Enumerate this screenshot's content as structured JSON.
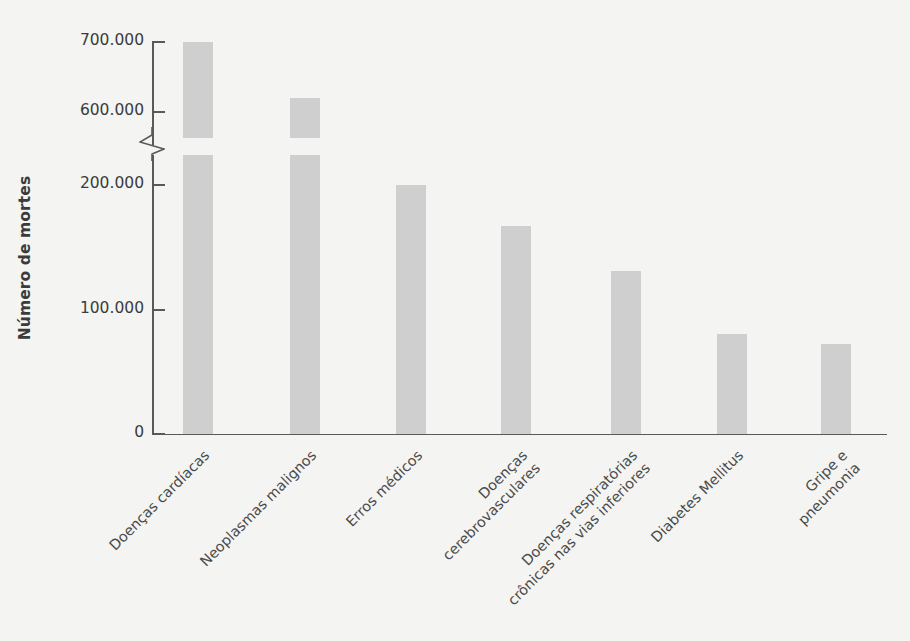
{
  "chart_data": {
    "type": "bar",
    "title": "",
    "xlabel": "",
    "ylabel": "Número de mortes",
    "categories": [
      "Doenças cardíacas",
      "Neoplasmas malignos",
      "Erros médicos",
      "Doenças\ncerebrovasculares",
      "Doenças respiratórias\ncrônicas nas vias inferiores",
      "Diabetes Mellitus",
      "Gripe e\npneumonia"
    ],
    "values": [
      700000,
      620000,
      200000,
      167000,
      131000,
      80000,
      72000
    ],
    "value_labels": [
      "700.000",
      "620.000",
      "200.000",
      "167.000",
      "131.000",
      "80.000",
      "72.000"
    ],
    "ytick_labels": [
      "700.000",
      "600.000",
      "200.000",
      "100.000",
      "0"
    ],
    "ytick_values": [
      700000,
      600000,
      200000,
      100000,
      0
    ],
    "ylim": [
      0,
      700000
    ],
    "axis_break": {
      "present": true,
      "between": [
        200000,
        600000
      ]
    },
    "grid": false,
    "legend": null,
    "bar_color": "#cfcfcf",
    "axis_color": "#595959",
    "text_color": "#3b3b3b",
    "background_color": "#f4f4f2"
  }
}
